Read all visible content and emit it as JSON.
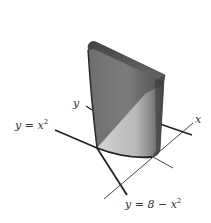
{
  "figure": {
    "labels": {
      "y_axis": "y",
      "x_axis": "x",
      "curve_lower_prefix": "y = x",
      "curve_lower_exp": "2",
      "curve_upper_prefix": "y = 8 − x",
      "curve_upper_exp": "2"
    },
    "colors": {
      "solid_dark": "#5a5a5a",
      "solid_mid": "#7a7a7a",
      "solid_light": "#c8c8c8",
      "top_edge": "#2a2a2a",
      "axis_line": "#222222",
      "background": "#ffffff"
    }
  }
}
